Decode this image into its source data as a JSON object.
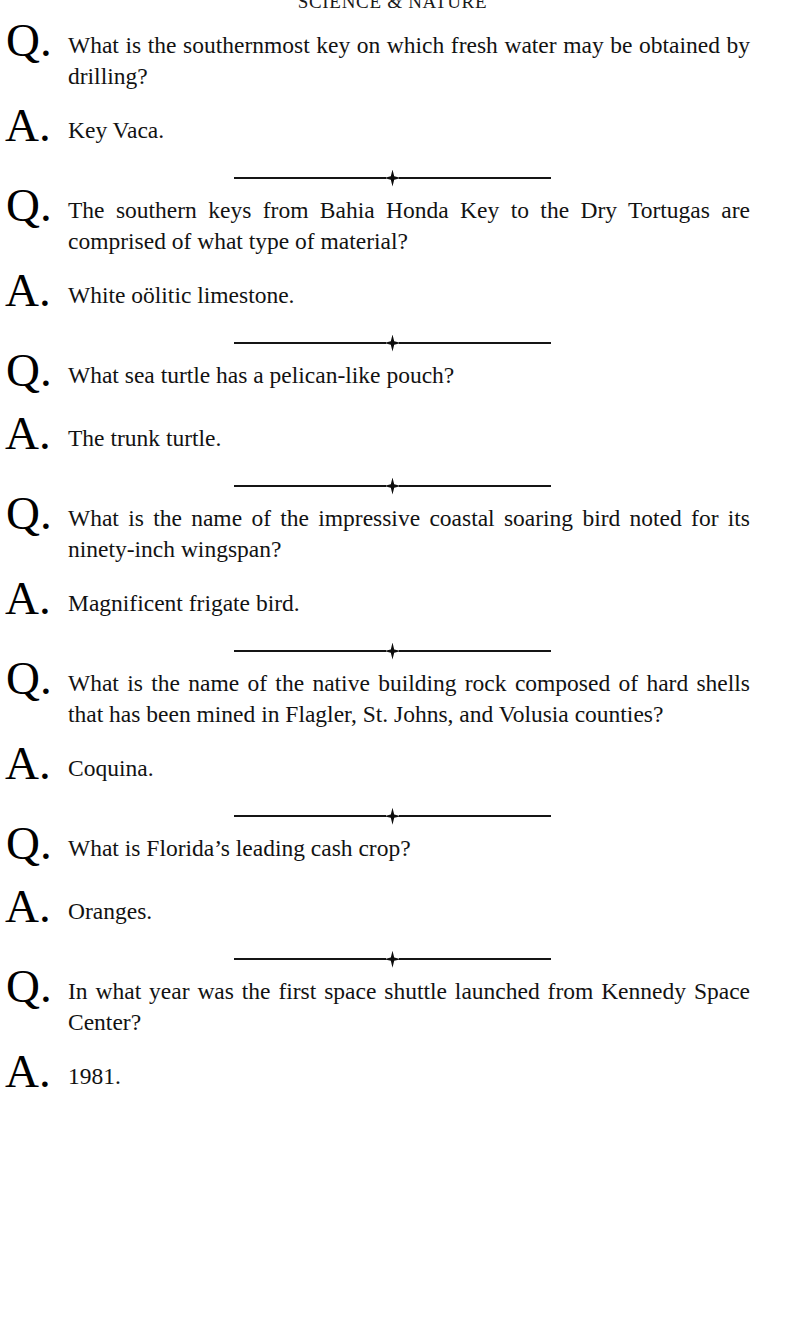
{
  "page": {
    "running_head": "SCIENCE & NATURE",
    "background_color": "#ffffff",
    "text_color": "#121212",
    "question_marker": "Q.",
    "answer_marker": "A.",
    "ornament_glyph": "four-point-star"
  },
  "entries": [
    {
      "question": "What is the southernmost key on which fresh water may be obtained by drilling?",
      "answer": "Key Vaca."
    },
    {
      "question": "The southern keys from Bahia Honda Key to the Dry Tortugas are comprised of what type of material?",
      "answer": "White oölitic limestone."
    },
    {
      "question": "What sea turtle has a pelican-like pouch?",
      "answer": "The trunk turtle."
    },
    {
      "question": "What is the name of the impressive coastal soaring bird noted for its ninety-inch wingspan?",
      "answer": "Magnificent frigate bird."
    },
    {
      "question": "What is the name of the native building rock composed of hard shells that has been mined in Flagler, St. Johns, and Volusia counties?",
      "answer": "Coquina."
    },
    {
      "question": "What is Florida’s leading cash crop?",
      "answer": "Oranges."
    },
    {
      "question": "In what year was the first space shuttle launched from Kennedy Space Center?",
      "answer": "1981."
    }
  ]
}
